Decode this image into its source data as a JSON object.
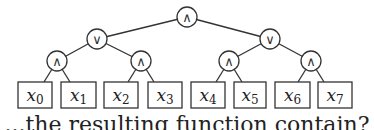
{
  "diagram": {
    "type": "boolean-circuit-tree",
    "root": {
      "id": "and-root",
      "op": "∧",
      "cx": 187,
      "cy": 17
    },
    "gates": [
      {
        "id": "and-root",
        "op": "∧",
        "cx": 187,
        "cy": 17
      },
      {
        "id": "or-left",
        "op": "∨",
        "cx": 97,
        "cy": 39
      },
      {
        "id": "or-right",
        "op": "∨",
        "cx": 270,
        "cy": 39
      },
      {
        "id": "and-l1",
        "op": "∧",
        "cx": 57,
        "cy": 61
      },
      {
        "id": "and-l2",
        "op": "∧",
        "cx": 141,
        "cy": 61
      },
      {
        "id": "and-r1",
        "op": "∧",
        "cx": 229,
        "cy": 61
      },
      {
        "id": "and-r2",
        "op": "∧",
        "cx": 311,
        "cy": 61
      }
    ],
    "leaves": [
      {
        "var": "x",
        "sub": "0",
        "x": 18,
        "w": 34
      },
      {
        "var": "x",
        "sub": "1",
        "x": 61,
        "w": 35
      },
      {
        "var": "x",
        "sub": "2",
        "x": 104,
        "w": 34
      },
      {
        "var": "x",
        "sub": "3",
        "x": 148,
        "w": 34
      },
      {
        "var": "x",
        "sub": "4",
        "x": 191,
        "w": 34
      },
      {
        "var": "x",
        "sub": "5",
        "x": 234,
        "w": 32
      },
      {
        "var": "x",
        "sub": "6",
        "x": 275,
        "w": 35
      },
      {
        "var": "x",
        "sub": "7",
        "x": 318,
        "w": 34
      }
    ],
    "edges": [
      [
        "and-root",
        "or-left"
      ],
      [
        "and-root",
        "or-right"
      ],
      [
        "or-left",
        "and-l1"
      ],
      [
        "or-left",
        "and-l2"
      ],
      [
        "or-right",
        "and-r1"
      ],
      [
        "or-right",
        "and-r2"
      ],
      [
        "and-l1",
        "x0"
      ],
      [
        "and-l1",
        "x1"
      ],
      [
        "and-l2",
        "x2"
      ],
      [
        "and-l2",
        "x3"
      ],
      [
        "and-r1",
        "x4"
      ],
      [
        "and-r1",
        "x5"
      ],
      [
        "and-r2",
        "x6"
      ],
      [
        "and-r2",
        "x7"
      ]
    ]
  },
  "caption": "...the resulting function contain?"
}
